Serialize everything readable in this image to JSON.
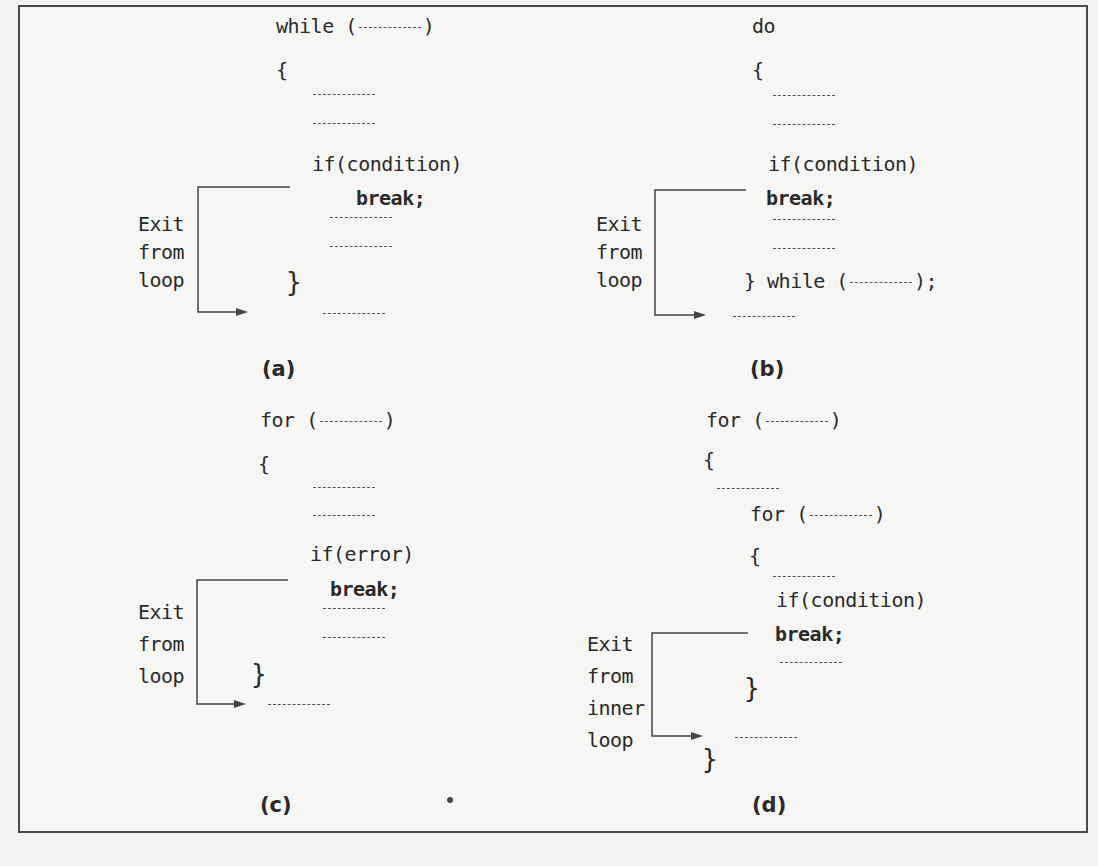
{
  "figure": {
    "panels": [
      {
        "id": "a",
        "caption": "(a)",
        "loop_header": "while (",
        "header_close": ")",
        "open_brace": "{",
        "condition": "if(condition)",
        "break_stmt": "break;",
        "close_brace": "}",
        "exit_label": [
          "Exit",
          "from",
          "loop"
        ]
      },
      {
        "id": "b",
        "caption": "(b)",
        "loop_header": "do",
        "open_brace": "{",
        "condition": "if(condition)",
        "break_stmt": "break;",
        "close_while": "} while (",
        "close_while_end": ");",
        "exit_label": [
          "Exit",
          "from",
          "loop"
        ]
      },
      {
        "id": "c",
        "caption": "(c)",
        "loop_header": "for (",
        "header_close": ")",
        "open_brace": "{",
        "condition": "if(error)",
        "break_stmt": "break;",
        "close_brace": "}",
        "exit_label": [
          "Exit",
          "from",
          "loop"
        ]
      },
      {
        "id": "d",
        "caption": "(d)",
        "outer_header": "for (",
        "outer_close": ")",
        "outer_open_brace": "{",
        "inner_header": "for (",
        "inner_close": ")",
        "inner_open_brace": "{",
        "condition": "if(condition)",
        "break_stmt": "break;",
        "inner_close_brace": "}",
        "outer_close_brace": "}",
        "exit_label": [
          "Exit",
          "from",
          "inner",
          "loop"
        ]
      }
    ]
  },
  "colors": {
    "page": "#f3f3f1",
    "ink": "#2a2a2a",
    "frame": "#4a4a4a"
  }
}
